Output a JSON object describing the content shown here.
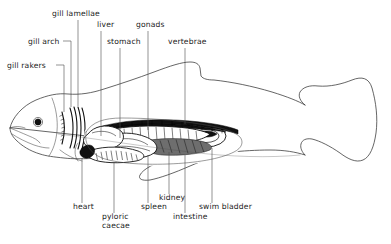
{
  "diagram": {
    "background_color": "#ffffff",
    "line_color": "#333333",
    "text_color": "#1a1a1a",
    "width": 391,
    "height": 244
  },
  "labels": {
    "gill_lamellae": "gill lamellae",
    "gill_arch": "gill arch",
    "gill_rakers": "gill rakers",
    "liver": "liver",
    "stomach": "stomach",
    "gonads": "gonads",
    "vertebrae": "vertebrae",
    "heart": "heart",
    "pyloric_caecae_line1": "pyloric",
    "pyloric_caecae_line2": "caecae",
    "spleen": "spleen",
    "kidney": "kidney",
    "intestine": "intestine",
    "swim_bladder": "swim bladder"
  },
  "label_positions": {
    "gill_lamellae": {
      "x": 52,
      "y": 16,
      "anchor": "start"
    },
    "gill_arch": {
      "x": 28,
      "y": 44,
      "anchor": "start"
    },
    "gill_rakers": {
      "x": 7,
      "y": 68,
      "anchor": "start"
    },
    "liver": {
      "x": 97,
      "y": 27,
      "anchor": "start"
    },
    "stomach": {
      "x": 107,
      "y": 44,
      "anchor": "start"
    },
    "gonads": {
      "x": 136,
      "y": 27,
      "anchor": "start"
    },
    "vertebrae": {
      "x": 168,
      "y": 44,
      "anchor": "start"
    },
    "heart": {
      "x": 73,
      "y": 209,
      "anchor": "start"
    },
    "pyloric_caecae": {
      "x": 102,
      "y": 219,
      "anchor": "start"
    },
    "spleen": {
      "x": 141,
      "y": 209,
      "anchor": "start"
    },
    "kidney": {
      "x": 159,
      "y": 200,
      "anchor": "start"
    },
    "intestine": {
      "x": 173,
      "y": 219,
      "anchor": "start"
    },
    "swim_bladder": {
      "x": 199,
      "y": 209,
      "anchor": "start"
    }
  },
  "organ_colors": {
    "dark": "#111111",
    "mid_gray": "#6e6e6e",
    "light": "#ffffff",
    "outline": "#333333"
  }
}
